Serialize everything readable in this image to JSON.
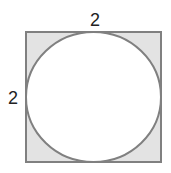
{
  "diagram": {
    "square": {
      "side_label": "2",
      "fill": "#e3e3e3",
      "stroke": "#808080"
    },
    "circle": {
      "fill": "#ffffff",
      "stroke": "#808080"
    },
    "labels": {
      "top": "2",
      "left": "2"
    }
  }
}
